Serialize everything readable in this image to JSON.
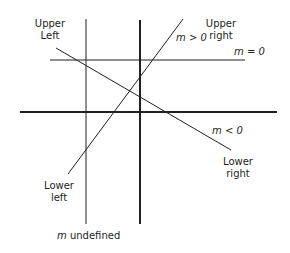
{
  "diagram": {
    "type": "slope-of-lines",
    "axes": {
      "x_axis": {
        "y": 112,
        "x1": 20,
        "x2": 277,
        "stroke_width": 2
      },
      "y_axis": {
        "x": 140,
        "y1": 20,
        "y2": 224,
        "stroke_width": 2
      }
    },
    "lines": [
      {
        "name": "m-undefined-line",
        "x1": 86,
        "y1": 19,
        "x2": 86,
        "y2": 224,
        "label": "m undefined"
      },
      {
        "name": "m-zero-line",
        "x1": 50,
        "y1": 60,
        "x2": 245,
        "y2": 60,
        "label": "m = 0"
      },
      {
        "name": "m-positive-line",
        "x1": 183,
        "y1": 19,
        "x2": 68,
        "y2": 174,
        "label": "m > 0"
      },
      {
        "name": "m-negative-line",
        "x1": 56,
        "y1": 48,
        "x2": 231,
        "y2": 150,
        "label": "m < 0"
      }
    ],
    "labels": {
      "upper_left": {
        "line1": "Upper",
        "line2": "Left"
      },
      "upper_right": {
        "line1": "Upper",
        "line2": "right"
      },
      "lower_left": {
        "line1": "Lower",
        "line2": "left"
      },
      "lower_right": {
        "line1": "Lower",
        "line2": "right"
      },
      "m_positive": {
        "var": "m",
        "rest": " > 0"
      },
      "m_zero": {
        "var": "m",
        "rest": " = 0"
      },
      "m_negative": {
        "var": "m",
        "rest": " < 0"
      },
      "m_undefined": {
        "var": "m",
        "rest": " undefined"
      }
    },
    "colors": {
      "line": "#231f20",
      "background": "#ffffff"
    }
  }
}
